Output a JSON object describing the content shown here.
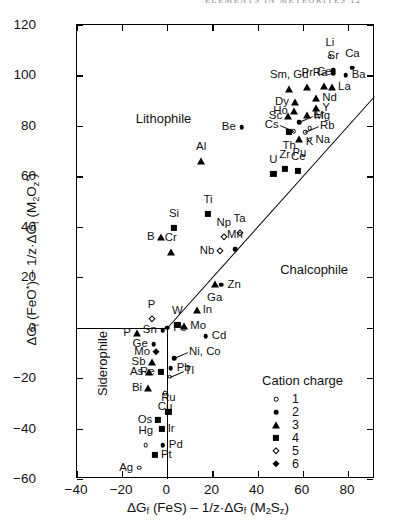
{
  "page_header": "ELEMENTS IN METEORITES   12",
  "chart_data": {
    "type": "scatter",
    "title": "",
    "xlabel": "ΔG_f (FeS) − 1/z·ΔG_f (M₂S_z)",
    "ylabel": "ΔG_f (FeO*) − 1/z·ΔG_f (M₂O_z*)",
    "xlim": [
      -40,
      92
    ],
    "ylim": [
      -60,
      120
    ],
    "xticks": [
      -40,
      -20,
      0,
      20,
      40,
      60,
      80
    ],
    "yticks": [
      -60,
      -40,
      -20,
      0,
      20,
      40,
      60,
      80,
      100,
      120
    ],
    "grid": false,
    "legend_position": "lower-right-inside",
    "region_labels": [
      {
        "text": "Lithophile",
        "x": -14,
        "y": 86
      },
      {
        "text": "Chalcophile",
        "x": 50,
        "y": 26
      },
      {
        "text": "Siderophile",
        "x": -32,
        "y": -27
      }
    ],
    "divider_line": {
      "from": [
        0,
        0
      ],
      "to": [
        92,
        92
      ],
      "note": "1:1 separation line"
    },
    "zero_axes": {
      "horizontal_y": 0,
      "vertical_x": 0
    },
    "points": [
      {
        "el": "Li",
        "x": 72.0,
        "y": 107.5,
        "charge": 1,
        "lab": "above"
      },
      {
        "el": "Sr",
        "x": 73.5,
        "y": 102.0,
        "charge": 2,
        "lab": "above"
      },
      {
        "el": "Ra",
        "x": 73.5,
        "y": 101.0,
        "charge": 2,
        "lab": "left"
      },
      {
        "el": "Ca",
        "x": 82.0,
        "y": 103.0,
        "charge": 2,
        "lab": "above"
      },
      {
        "el": "Ba",
        "x": 79.0,
        "y": 100.0,
        "charge": 2,
        "lab": "right"
      },
      {
        "el": "Sm, Gd",
        "x": 54.0,
        "y": 94.5,
        "charge": 3,
        "lab": "above"
      },
      {
        "el": "Pr",
        "x": 62.0,
        "y": 95.5,
        "charge": 3,
        "lab": "above"
      },
      {
        "el": "Ce",
        "x": 69.5,
        "y": 96.0,
        "charge": 3,
        "lab": "above"
      },
      {
        "el": "La",
        "x": 73.0,
        "y": 95.5,
        "charge": 3,
        "lab": "right"
      },
      {
        "el": "Nd",
        "x": 66.0,
        "y": 91.0,
        "charge": 3,
        "lab": "right"
      },
      {
        "el": "Dy",
        "x": 56.5,
        "y": 89.5,
        "charge": 3,
        "lab": "left"
      },
      {
        "el": "Y",
        "x": 66.0,
        "y": 87.0,
        "charge": 3,
        "lab": "right"
      },
      {
        "el": "Ho",
        "x": 56.0,
        "y": 86.0,
        "charge": 3,
        "lab": "left"
      },
      {
        "el": "Er",
        "x": 62.0,
        "y": 84.5,
        "charge": 3,
        "lab": "right"
      },
      {
        "el": "Sc",
        "x": 53.5,
        "y": 84.0,
        "charge": 3,
        "lab": "left"
      },
      {
        "el": "Mg",
        "x": 58.5,
        "y": 81.5,
        "charge": 2,
        "lab": "line-right"
      },
      {
        "el": "K",
        "x": 63.0,
        "y": 79.0,
        "charge": 1,
        "lab": "below"
      },
      {
        "el": "Cs",
        "x": 56.0,
        "y": 78.0,
        "charge": 1,
        "lab": "line-left"
      },
      {
        "el": "Rb",
        "x": 61.0,
        "y": 77.5,
        "charge": 1,
        "lab": "line-right"
      },
      {
        "el": "Th",
        "x": 54.0,
        "y": 77.5,
        "charge": 4,
        "lab": "below"
      },
      {
        "el": "Pu",
        "x": 58.5,
        "y": 75.0,
        "charge": 3,
        "lab": "below"
      },
      {
        "el": "Na",
        "x": 63.0,
        "y": 74.5,
        "charge": 1,
        "lab": "right"
      },
      {
        "el": "Be",
        "x": 33.0,
        "y": 79.5,
        "charge": 2,
        "lab": "left"
      },
      {
        "el": "U",
        "x": 47.0,
        "y": 61.0,
        "charge": 4,
        "lab": "above"
      },
      {
        "el": "Zr",
        "x": 52.0,
        "y": 63.0,
        "charge": 4,
        "lab": "above"
      },
      {
        "el": "Ce",
        "x": 58.0,
        "y": 62.0,
        "charge": 4,
        "lab": "above"
      },
      {
        "el": "Al",
        "x": 15.0,
        "y": 66.0,
        "charge": 3,
        "lab": "above"
      },
      {
        "el": "Ti",
        "x": 18.0,
        "y": 45.0,
        "charge": 4,
        "lab": "above"
      },
      {
        "el": "Si",
        "x": 3.0,
        "y": 39.5,
        "charge": 4,
        "lab": "above"
      },
      {
        "el": "B",
        "x": -3.0,
        "y": 36.0,
        "charge": 3,
        "lab": "left"
      },
      {
        "el": "Np",
        "x": 25.0,
        "y": 36.0,
        "charge": 5,
        "lab": "above"
      },
      {
        "el": "Ta",
        "x": 32.0,
        "y": 37.5,
        "charge": 5,
        "lab": "above"
      },
      {
        "el": "Mn",
        "x": 30.0,
        "y": 31.0,
        "charge": 2,
        "lab": "above"
      },
      {
        "el": "Nb",
        "x": 23.5,
        "y": 30.5,
        "charge": 5,
        "lab": "left"
      },
      {
        "el": "Cr",
        "x": 1.5,
        "y": 30.0,
        "charge": 3,
        "lab": "above"
      },
      {
        "el": "Ga",
        "x": 21.0,
        "y": 17.5,
        "charge": 3,
        "lab": "below"
      },
      {
        "el": "Zn",
        "x": 24.0,
        "y": 17.0,
        "charge": 2,
        "lab": "right"
      },
      {
        "el": "In",
        "x": 13.0,
        "y": 7.0,
        "charge": 3,
        "lab": "right"
      },
      {
        "el": "W",
        "x": 4.5,
        "y": 1.0,
        "charge": 4,
        "lab": "above"
      },
      {
        "el": "Mo",
        "x": 7.5,
        "y": 0.5,
        "charge": 3,
        "lab": "right"
      },
      {
        "el": "Fe",
        "x": 0.0,
        "y": 0.0,
        "charge": 2,
        "lab": "right"
      },
      {
        "el": "Sn",
        "x": -2.0,
        "y": -1.0,
        "charge": 2,
        "lab": "left"
      },
      {
        "el": "P",
        "x": -7.0,
        "y": 3.5,
        "charge": 5,
        "lab": "above"
      },
      {
        "el": "P",
        "x": -13.5,
        "y": -2.0,
        "charge": 3,
        "lab": "left"
      },
      {
        "el": "Cd",
        "x": 17.0,
        "y": -3.5,
        "charge": 2,
        "lab": "right"
      },
      {
        "el": "Ge",
        "x": -6.0,
        "y": -6.5,
        "charge": 2,
        "lab": "left"
      },
      {
        "el": "Mo",
        "x": -5.0,
        "y": -9.5,
        "charge": 6,
        "lab": "left"
      },
      {
        "el": "Ni, Co",
        "x": 3.0,
        "y": -12.0,
        "charge": 2,
        "lab": "line-right"
      },
      {
        "el": "Sb",
        "x": -7.0,
        "y": -13.5,
        "charge": 3,
        "lab": "left"
      },
      {
        "el": "Pb",
        "x": 1.5,
        "y": -16.0,
        "charge": 2,
        "lab": "right"
      },
      {
        "el": "As",
        "x": -8.0,
        "y": -17.5,
        "charge": 3,
        "lab": "left"
      },
      {
        "el": "Re",
        "x": -3.0,
        "y": -17.5,
        "charge": 4,
        "lab": "left"
      },
      {
        "el": "Tl",
        "x": 1.0,
        "y": -19.5,
        "charge": 1,
        "lab": "line-right"
      },
      {
        "el": "Bi",
        "x": -8.5,
        "y": -24.0,
        "charge": 3,
        "lab": "left"
      },
      {
        "el": "Cu",
        "x": -1.0,
        "y": -26.0,
        "charge": 1,
        "lab": "below"
      },
      {
        "el": "Ru",
        "x": 0.5,
        "y": -33.5,
        "charge": 4,
        "lab": "above"
      },
      {
        "el": "Os",
        "x": -4.0,
        "y": -36.5,
        "charge": 4,
        "lab": "left"
      },
      {
        "el": "Ir",
        "x": -2.5,
        "y": -40.0,
        "charge": 4,
        "lab": "right"
      },
      {
        "el": "Hg",
        "x": -9.5,
        "y": -46.5,
        "charge": 1,
        "lab": "above"
      },
      {
        "el": "Pd",
        "x": -2.0,
        "y": -46.5,
        "charge": 2,
        "lab": "right"
      },
      {
        "el": "Pt",
        "x": -5.5,
        "y": -50.5,
        "charge": 4,
        "lab": "right"
      },
      {
        "el": "Ag",
        "x": -12.5,
        "y": -55.5,
        "charge": 1,
        "lab": "left"
      }
    ],
    "legend": {
      "title": "Cation charge",
      "entries": [
        {
          "symbol": "open-circle",
          "label": "1"
        },
        {
          "symbol": "filled-circle",
          "label": "2"
        },
        {
          "symbol": "filled-triangle",
          "label": "3"
        },
        {
          "symbol": "filled-square",
          "label": "4"
        },
        {
          "symbol": "open-diamond",
          "label": "5"
        },
        {
          "symbol": "filled-diamond",
          "label": "6"
        }
      ]
    }
  }
}
